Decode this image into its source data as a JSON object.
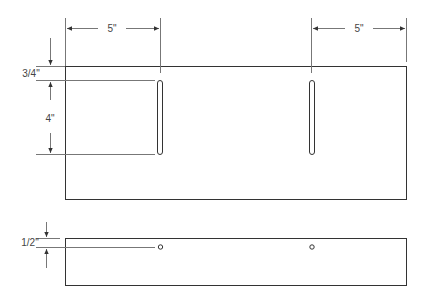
{
  "diagram": {
    "type": "technical-drawing",
    "colors": {
      "line": "#333333",
      "dim_line": "#777777",
      "text": "#444444",
      "background": "#ffffff"
    },
    "top_view": {
      "dimensions": {
        "left_slot_offset": "5\"",
        "right_slot_offset": "5\"",
        "slot_top_offset": "3/4\"",
        "slot_length": "4\""
      },
      "slots": [
        {
          "name": "left-slot"
        },
        {
          "name": "right-slot"
        }
      ]
    },
    "side_view": {
      "dimensions": {
        "hole_offset": "1/2\""
      },
      "holes": [
        {
          "name": "left-hole"
        },
        {
          "name": "right-hole"
        }
      ]
    }
  }
}
